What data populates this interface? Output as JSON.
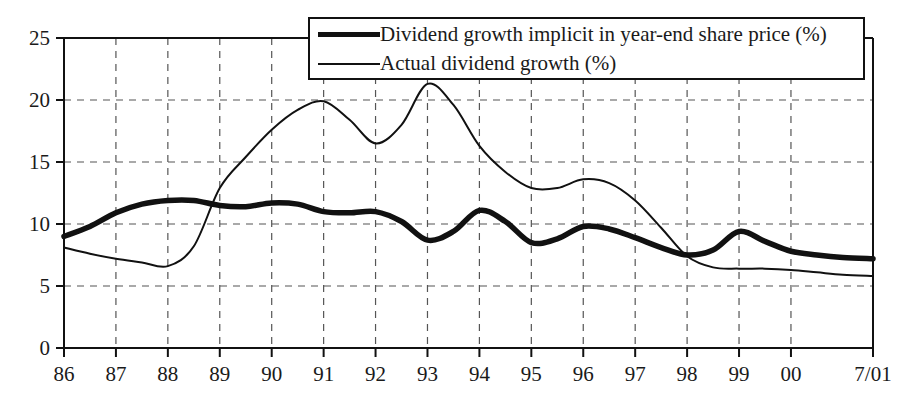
{
  "chart_data": {
    "type": "line",
    "title": "",
    "xlabel": "",
    "ylabel": "",
    "xlim": [
      1986,
      2001.58
    ],
    "ylim": [
      0,
      25
    ],
    "yticks": [
      0,
      5,
      10,
      15,
      20,
      25
    ],
    "ytick_labels": [
      "0",
      "5",
      "10",
      "15",
      "20",
      "25"
    ],
    "xtick_labels": [
      "86",
      "87",
      "88",
      "89",
      "90",
      "91",
      "92",
      "93",
      "94",
      "95",
      "96",
      "97",
      "98",
      "99",
      "00",
      "7/01"
    ],
    "xtick_values": [
      1986,
      1987,
      1988,
      1989,
      1990,
      1991,
      1992,
      1993,
      1994,
      1995,
      1996,
      1997,
      1998,
      1999,
      2000,
      2001.58
    ],
    "grid": "dashed-both",
    "legend_position": "top-center",
    "series": [
      {
        "name": "Dividend growth implicit in year-end share price (%)",
        "style": "thick",
        "color": "#111111",
        "x": [
          1986,
          1986.5,
          1987,
          1987.5,
          1988,
          1988.5,
          1989,
          1989.5,
          1990,
          1990.5,
          1991,
          1991.5,
          1992,
          1992.5,
          1993,
          1993.5,
          1994,
          1994.5,
          1995,
          1995.5,
          1996,
          1996.5,
          1997,
          1997.5,
          1998,
          1998.5,
          1999,
          1999.5,
          2000,
          2000.5,
          2001,
          2001.58
        ],
        "values": [
          9.0,
          9.8,
          10.9,
          11.6,
          11.9,
          11.9,
          11.5,
          11.4,
          11.7,
          11.6,
          11.0,
          10.9,
          11.0,
          10.2,
          8.7,
          9.4,
          11.1,
          10.2,
          8.5,
          8.8,
          9.8,
          9.6,
          8.9,
          8.1,
          7.5,
          7.9,
          9.4,
          8.6,
          7.8,
          7.5,
          7.3,
          7.2
        ]
      },
      {
        "name": "Actual dividend growth (%)",
        "style": "thin",
        "color": "#111111",
        "x": [
          1986,
          1986.5,
          1987,
          1987.5,
          1988,
          1988.5,
          1989,
          1989.5,
          1990,
          1990.5,
          1991,
          1991.5,
          1992,
          1992.5,
          1993,
          1993.5,
          1994,
          1994.5,
          1995,
          1995.5,
          1996,
          1996.5,
          1997,
          1997.5,
          1998,
          1998.5,
          1999,
          1999.5,
          2000,
          2000.5,
          2001,
          2001.58
        ],
        "values": [
          8.1,
          7.6,
          7.2,
          6.9,
          6.6,
          8.2,
          12.9,
          15.4,
          17.6,
          19.2,
          19.9,
          18.4,
          16.5,
          18.0,
          21.3,
          19.6,
          16.3,
          14.2,
          12.9,
          12.9,
          13.6,
          13.3,
          11.9,
          9.7,
          7.4,
          6.5,
          6.4,
          6.4,
          6.3,
          6.1,
          5.9,
          5.8
        ]
      }
    ]
  },
  "axes": {
    "left_px": 64,
    "right_px": 873,
    "top_px": 38,
    "bottom_px": 348
  },
  "legend": {
    "items": [
      {
        "label": "Dividend growth implicit in year-end share price (%)",
        "style": "thick"
      },
      {
        "label": "Actual dividend growth (%)",
        "style": "thin"
      }
    ]
  }
}
